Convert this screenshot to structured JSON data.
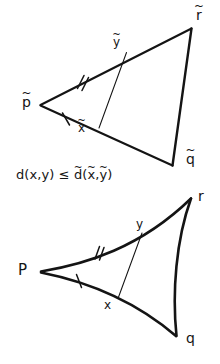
{
  "figure": {
    "kind": "hand-drawn-math-diagram",
    "topic": "comparison triangle and CAT(0) geodesic triangle",
    "ink_color": "#141414",
    "background_color": "#ffffff"
  },
  "upper_triangle": {
    "name": "comparison-triangle",
    "vertices": [
      {
        "id": "p-tilde",
        "base": "p",
        "accent": "~",
        "x": 40,
        "y": 105
      },
      {
        "id": "r-tilde",
        "base": "r",
        "accent": "~",
        "x": 192,
        "y": 28
      },
      {
        "id": "q-tilde",
        "base": "q",
        "accent": "~",
        "x": 173,
        "y": 165
      }
    ],
    "points": [
      {
        "id": "x-tilde",
        "base": "x",
        "accent": "~",
        "x": 99,
        "y": 128,
        "on_edge": "p-tilde to q-tilde"
      },
      {
        "id": "y-tilde",
        "base": "y",
        "accent": "~",
        "x": 126,
        "y": 53,
        "on_edge": "p-tilde to r-tilde"
      }
    ],
    "chord": {
      "from": "x-tilde",
      "to": "y-tilde"
    },
    "tick_marks": [
      {
        "edge": "p-tilde to r-tilde",
        "count": 2,
        "x": 81,
        "y": 82
      },
      {
        "edge": "p-tilde to q-tilde",
        "count": 1,
        "x": 66,
        "y": 119
      }
    ],
    "labels": {
      "p": "p",
      "r": "r",
      "q": "q",
      "x": "x",
      "y": "y",
      "accent": "~"
    }
  },
  "caption": {
    "id": "distance-inequality",
    "parts": {
      "lhs_fn": "d",
      "lhs_open": "(",
      "lhs_x": "x",
      "comma": ",",
      "lhs_y": "y",
      "lhs_close": ")",
      "relation": "≤",
      "rhs_fn": "d",
      "rhs_accent": "~",
      "rhs_open": "(",
      "rhs_x": "x",
      "rhs_y": "y",
      "rhs_close": ")"
    },
    "plain_text": "d(x,y) ≤ d̃(x̃,ỹ)"
  },
  "lower_triangle": {
    "name": "geodesic-triangle",
    "note": "sides drawn concave (curved inward)",
    "vertices": [
      {
        "id": "p",
        "base": "P",
        "accent": "",
        "x": 40,
        "y": 272
      },
      {
        "id": "r",
        "base": "r",
        "accent": "",
        "x": 192,
        "y": 198
      },
      {
        "id": "q",
        "base": "q",
        "accent": "",
        "x": 176,
        "y": 336
      }
    ],
    "points": [
      {
        "id": "x",
        "base": "x",
        "accent": "",
        "x": 118,
        "y": 299,
        "on_edge": "P to q"
      },
      {
        "id": "y",
        "base": "y",
        "accent": "",
        "x": 142,
        "y": 233,
        "on_edge": "P to r"
      }
    ],
    "chord": {
      "from": "x",
      "to": "y"
    },
    "tick_marks": [
      {
        "edge": "P to r",
        "count": 2,
        "x": 99,
        "y": 253
      },
      {
        "edge": "P to q",
        "count": 1,
        "x": 79,
        "y": 281
      }
    ],
    "labels": {
      "p": "P",
      "r": "r",
      "q": "q",
      "x": "x",
      "y": "y"
    }
  }
}
